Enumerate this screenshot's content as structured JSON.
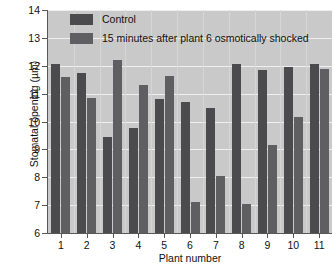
{
  "chart_data": {
    "type": "bar",
    "title": "",
    "xlabel": "Plant number",
    "ylabel": "Stomatal opening (µm)",
    "ylim": [
      6,
      14
    ],
    "yticks": [
      6,
      7,
      8,
      9,
      10,
      11,
      12,
      13,
      14
    ],
    "ytick_labels": [
      "6",
      "7",
      "8",
      "9",
      "10",
      "11",
      "12",
      "13",
      "14"
    ],
    "grid": true,
    "legend_position": "top-left-inside",
    "categories": [
      "1",
      "2",
      "3",
      "4",
      "5",
      "6",
      "7",
      "8",
      "9",
      "10",
      "11"
    ],
    "series": [
      {
        "name": "Control",
        "color": "#4b4b4d",
        "values": [
          12.05,
          11.75,
          9.45,
          9.75,
          10.8,
          10.7,
          10.5,
          12.05,
          11.85,
          11.95,
          12.05
        ]
      },
      {
        "name": "15 minutes after plant 6 osmotically shocked",
        "color": "#5f5f61",
        "values": [
          11.6,
          10.85,
          12.2,
          11.3,
          11.65,
          7.1,
          8.05,
          7.05,
          9.15,
          10.15,
          11.9
        ]
      }
    ]
  },
  "legend": {
    "items": [
      {
        "label": "Control",
        "swatch": "control"
      },
      {
        "label": "15 minutes after plant 6 osmotically shocked",
        "swatch": "shock"
      }
    ]
  },
  "axes": {
    "x_title": "Plant number",
    "y_title": "Stomatal opening (µm)"
  },
  "colors": {
    "plot_background": "#c9c9c9",
    "gridline": "#efefef",
    "axis": "#58585a",
    "control_bar": "#4b4b4d",
    "shock_bar": "#5f5f61",
    "page_background": "#ffffff"
  }
}
